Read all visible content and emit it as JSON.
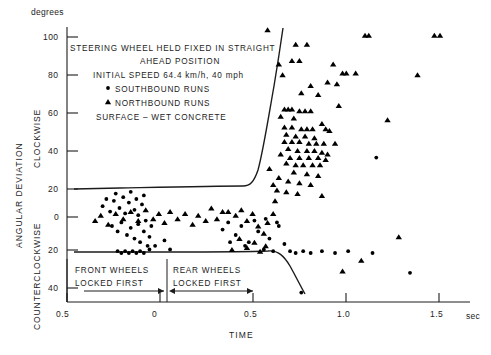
{
  "axes": {
    "y_unit": "degrees",
    "y_title": "ANGULAR  DEVIATION",
    "y_upper_dir": "CLOCKWISE",
    "y_lower_dir": "COUNTERCLOCKWISE",
    "x_title": "TIME",
    "x_unit": "sec",
    "y_ticks": [
      "100",
      "80",
      "60",
      "40",
      "20",
      "0",
      "20",
      "40"
    ],
    "x_ticks": [
      "0.5",
      "0",
      "0.5",
      "1.0",
      "1.5"
    ]
  },
  "legend": {
    "line1": "STEERING  WHEEL  HELD  FIXED  IN  STRAIGHT",
    "line2": "AHEAD  POSITION",
    "line3": "INITIAL  SPEED  64.4 km/h,  40 mph",
    "line4": "SOUTHBOUND  RUNS",
    "line5": "NORTHBOUND  RUNS",
    "line6": "SURFACE – WET  CONCRETE",
    "marker_south": "filled-circle",
    "marker_north": "filled-triangle"
  },
  "annotations": {
    "front_l1": "FRONT  WHEELS",
    "front_l2": "LOCKED  FIRST",
    "rear_l1": "REAR  WHEELS",
    "rear_l2": "LOCKED  FIRST"
  },
  "chart_data": {
    "type": "scatter",
    "title": "",
    "xlabel": "TIME",
    "ylabel": "ANGULAR DEVIATION",
    "xunit": "sec",
    "yunit": "degrees",
    "xlim": [
      -0.5,
      1.65
    ],
    "ylim": [
      -45,
      108
    ],
    "grid": false,
    "legend_position": "upper-left-inside",
    "series": [
      {
        "name": "SOUTHBOUND RUNS",
        "marker": "circle",
        "color": "#000000",
        "points": [
          [
            -0.31,
            6
          ],
          [
            -0.29,
            10
          ],
          [
            -0.27,
            3
          ],
          [
            -0.25,
            9
          ],
          [
            -0.24,
            13
          ],
          [
            -0.22,
            5
          ],
          [
            -0.2,
            11
          ],
          [
            -0.19,
            2
          ],
          [
            -0.17,
            8
          ],
          [
            -0.16,
            14
          ],
          [
            -0.14,
            4
          ],
          [
            -0.13,
            10
          ],
          [
            -0.12,
            1
          ],
          [
            -0.1,
            7
          ],
          [
            -0.09,
            12
          ],
          [
            -0.26,
            -5
          ],
          [
            -0.23,
            -8
          ],
          [
            -0.21,
            -3
          ],
          [
            -0.18,
            -10
          ],
          [
            -0.16,
            -6
          ],
          [
            -0.14,
            -12
          ],
          [
            -0.12,
            -4
          ],
          [
            -0.11,
            -14
          ],
          [
            -0.09,
            -8
          ],
          [
            -0.08,
            -2
          ],
          [
            -0.07,
            -16
          ],
          [
            -0.06,
            -11
          ],
          [
            -0.05,
            -5
          ],
          [
            -0.23,
            -19
          ],
          [
            -0.21,
            -20
          ],
          [
            -0.19,
            -19
          ],
          [
            -0.17,
            -20
          ],
          [
            -0.15,
            -19
          ],
          [
            -0.13,
            -20
          ],
          [
            -0.11,
            -19
          ],
          [
            -0.09,
            -20
          ],
          [
            -0.06,
            -18
          ],
          [
            -0.03,
            -16
          ],
          [
            0.02,
            -13
          ],
          [
            0.05,
            -18
          ],
          [
            0.33,
            -7
          ],
          [
            0.36,
            -3
          ],
          [
            0.4,
            -10
          ],
          [
            0.43,
            -5
          ],
          [
            0.47,
            -14
          ],
          [
            0.5,
            -2
          ],
          [
            0.52,
            -8
          ],
          [
            0.55,
            -18
          ],
          [
            0.58,
            -12
          ],
          [
            0.6,
            -19
          ],
          [
            0.63,
            -5
          ],
          [
            0.66,
            -15
          ],
          [
            0.69,
            -19
          ],
          [
            0.72,
            -20
          ],
          [
            0.76,
            -19
          ],
          [
            0.8,
            -20
          ],
          [
            0.86,
            -19
          ],
          [
            0.93,
            -20
          ],
          [
            1.0,
            -19
          ],
          [
            1.13,
            -20
          ],
          [
            0.56,
            -1
          ],
          [
            0.62,
            -3
          ],
          [
            0.45,
            -16
          ],
          [
            0.37,
            -14
          ],
          [
            1.33,
            -31
          ],
          [
            0.75,
            -42
          ],
          [
            1.15,
            33
          ]
        ]
      },
      {
        "name": "NORTHBOUND RUNS",
        "marker": "triangle",
        "color": "#000000",
        "points": [
          [
            0.57,
            104
          ],
          [
            0.72,
            96
          ],
          [
            0.78,
            96
          ],
          [
            1.09,
            101
          ],
          [
            1.11,
            101
          ],
          [
            1.46,
            101
          ],
          [
            1.49,
            101
          ],
          [
            0.63,
            85
          ],
          [
            0.7,
            87
          ],
          [
            0.74,
            87
          ],
          [
            0.92,
            85
          ],
          [
            0.65,
            79
          ],
          [
            0.97,
            80
          ],
          [
            0.99,
            80
          ],
          [
            1.04,
            80
          ],
          [
            0.89,
            75
          ],
          [
            0.94,
            74
          ],
          [
            0.8,
            73
          ],
          [
            0.75,
            69
          ],
          [
            0.84,
            68
          ],
          [
            1.37,
            79
          ],
          [
            0.95,
            62
          ],
          [
            0.66,
            60
          ],
          [
            0.68,
            60
          ],
          [
            0.7,
            60
          ],
          [
            0.74,
            59
          ],
          [
            0.77,
            59
          ],
          [
            0.8,
            59
          ],
          [
            0.64,
            56
          ],
          [
            0.71,
            55
          ],
          [
            0.86,
            52
          ],
          [
            0.66,
            50
          ],
          [
            0.7,
            50
          ],
          [
            0.75,
            49
          ],
          [
            0.78,
            49
          ],
          [
            0.81,
            49
          ],
          [
            0.88,
            49
          ],
          [
            0.67,
            46
          ],
          [
            0.72,
            45
          ],
          [
            0.77,
            45
          ],
          [
            0.82,
            44
          ],
          [
            0.66,
            42
          ],
          [
            0.7,
            42
          ],
          [
            0.74,
            42
          ],
          [
            0.79,
            41
          ],
          [
            0.83,
            41
          ],
          [
            0.87,
            41
          ],
          [
            0.9,
            48
          ],
          [
            0.68,
            38
          ],
          [
            0.73,
            37
          ],
          [
            0.78,
            37
          ],
          [
            0.82,
            37
          ],
          [
            0.86,
            36
          ],
          [
            0.64,
            35
          ],
          [
            0.69,
            33
          ],
          [
            0.74,
            33
          ],
          [
            0.79,
            33
          ],
          [
            0.84,
            33
          ],
          [
            0.88,
            32
          ],
          [
            0.67,
            30
          ],
          [
            0.72,
            29
          ],
          [
            0.76,
            29
          ],
          [
            0.81,
            29
          ],
          [
            0.85,
            29
          ],
          [
            0.89,
            35
          ],
          [
            0.71,
            25
          ],
          [
            0.78,
            24
          ],
          [
            0.84,
            23
          ],
          [
            0.63,
            22
          ],
          [
            0.68,
            20
          ],
          [
            0.74,
            19
          ],
          [
            0.8,
            18
          ],
          [
            0.62,
            15
          ],
          [
            0.67,
            14
          ],
          [
            0.73,
            13
          ],
          [
            0.86,
            12
          ],
          [
            0.93,
            41
          ],
          [
            1.21,
            54
          ],
          [
            0.58,
            27
          ],
          [
            0.6,
            18
          ],
          [
            0.61,
            9
          ],
          [
            0.6,
            2
          ],
          [
            0.57,
            -3
          ],
          [
            0.55,
            -9
          ],
          [
            0.36,
            3
          ],
          [
            0.4,
            1
          ],
          [
            0.43,
            4
          ],
          [
            0.46,
            -2
          ],
          [
            0.49,
            2
          ],
          [
            0.52,
            -5
          ],
          [
            0.3,
            -1
          ],
          [
            0.33,
            3
          ],
          [
            0.27,
            5
          ],
          [
            0.24,
            -2
          ],
          [
            0.2,
            1
          ],
          [
            0.17,
            -4
          ],
          [
            0.13,
            2
          ],
          [
            0.09,
            -1
          ],
          [
            0.05,
            3
          ],
          [
            0.02,
            -3
          ],
          [
            -0.01,
            2
          ],
          [
            -0.04,
            -1
          ],
          [
            -0.08,
            4
          ],
          [
            -0.12,
            -2
          ],
          [
            -0.16,
            3
          ],
          [
            -0.2,
            -1
          ],
          [
            -0.24,
            2
          ],
          [
            -0.28,
            -4
          ],
          [
            -0.32,
            1
          ],
          [
            -0.35,
            -2
          ],
          [
            0.56,
            -16
          ],
          [
            0.53,
            -19
          ],
          [
            0.5,
            -14
          ],
          [
            0.46,
            -17
          ],
          [
            0.42,
            -12
          ],
          [
            0.38,
            -18
          ],
          [
            1.27,
            -11
          ],
          [
            1.07,
            -24
          ],
          [
            0.97,
            -30
          ]
        ]
      }
    ],
    "envelope_upper": "flat near +15 deg from t=-0.35 to t=0.48, then rises steeply to +108 deg at t=0.60",
    "envelope_lower": "flat near -22 deg from t=-0.35 to t=0.62, then falls to -41 deg at t=0.78"
  }
}
